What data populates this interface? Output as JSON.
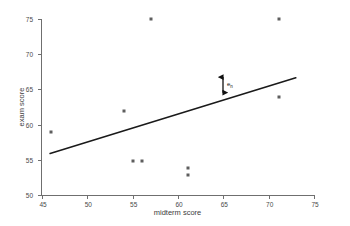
{
  "chart_data": {
    "type": "scatter",
    "title": "",
    "xlabel": "midterm score",
    "ylabel": "exam score",
    "xlim": [
      45,
      75
    ],
    "ylim": [
      50,
      75
    ],
    "xticks": [
      45,
      50,
      55,
      60,
      65,
      70,
      75
    ],
    "yticks": [
      50,
      55,
      60,
      65,
      70,
      75
    ],
    "grid": false,
    "legend": null,
    "series": [
      {
        "name": "students",
        "type": "scatter",
        "marker": "square",
        "color": "#5e5e5e",
        "points": [
          {
            "x": 46,
            "y": 59
          },
          {
            "x": 54,
            "y": 62
          },
          {
            "x": 55,
            "y": 55
          },
          {
            "x": 56,
            "y": 55
          },
          {
            "x": 57,
            "y": 75
          },
          {
            "x": 61,
            "y": 54
          },
          {
            "x": 61,
            "y": 53
          },
          {
            "x": 71,
            "y": 75
          },
          {
            "x": 71,
            "y": 64
          }
        ]
      },
      {
        "name": "regression line",
        "type": "line",
        "color": "#1a1a1a",
        "x": [
          46,
          73
        ],
        "y": [
          56.0,
          66.7
        ]
      }
    ],
    "annotations": [
      {
        "name": "residual-arrow",
        "type": "double-arrow",
        "x": 65,
        "y_top": 66.8,
        "y_bottom": 64.6,
        "label": "e",
        "label_sub": "n"
      }
    ]
  },
  "axes": {
    "x": {
      "label": "midterm score",
      "ticks": [
        "45",
        "50",
        "55",
        "60",
        "65",
        "70",
        "75"
      ]
    },
    "y": {
      "label": "exam score",
      "ticks": [
        "50",
        "55",
        "60",
        "65",
        "70",
        "75"
      ]
    }
  },
  "annotation": {
    "residual_symbol": "e",
    "residual_subscript": "n"
  },
  "colors": {
    "marker": "#5e5e5e",
    "line": "#1a1a1a",
    "axis": "#6f6f6f",
    "text": "#3c3c3c",
    "background": "#ffffff"
  }
}
